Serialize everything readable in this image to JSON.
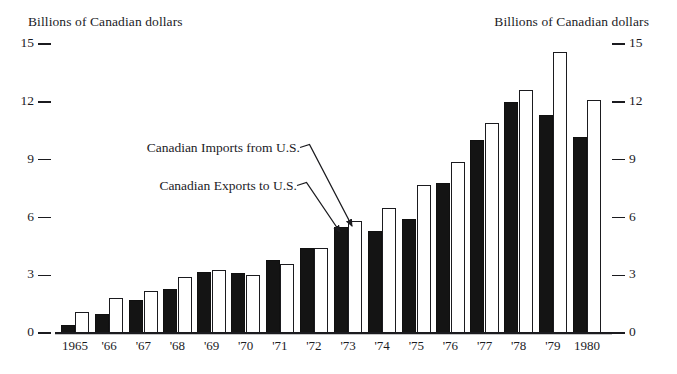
{
  "chart_data": {
    "type": "bar",
    "title": "",
    "axis_title_left": "Billions of Canadian dollars",
    "axis_title_right": "Billions of Canadian dollars",
    "xlabel": "",
    "ylabel": "Billions of Canadian dollars",
    "ylim": [
      0,
      15
    ],
    "yticks": [
      0,
      3,
      6,
      9,
      12,
      15
    ],
    "ytick_labels": [
      "0",
      "3",
      "6",
      "9",
      "12",
      "15"
    ],
    "grid": false,
    "legend_position": "annotation-labels-with-leader-lines",
    "categories": [
      "1965",
      "'66",
      "'67",
      "'68",
      "'69",
      "'70",
      "'71",
      "'72",
      "'73",
      "'74",
      "'75",
      "'76",
      "'77",
      "'78",
      "'79",
      "1980"
    ],
    "series": [
      {
        "name": "Canadian Exports to U.S.",
        "style": "solid-black",
        "color": "#141414",
        "values": [
          0.4,
          1.0,
          1.7,
          2.3,
          3.2,
          3.1,
          3.8,
          4.4,
          5.5,
          5.3,
          5.9,
          7.8,
          10.0,
          12.0,
          11.3,
          10.2
        ]
      },
      {
        "name": "Canadian Imports from U.S.",
        "style": "open-white",
        "color": "#ffffff",
        "values": [
          1.1,
          1.8,
          2.2,
          2.9,
          3.3,
          3.0,
          3.6,
          4.4,
          5.8,
          6.5,
          7.7,
          8.9,
          10.9,
          12.6,
          14.6,
          12.1
        ]
      }
    ],
    "annotations": [
      {
        "text": "Canadian Imports from U.S.",
        "points_to": "1973 open bar"
      },
      {
        "text": "Canadian Exports to U.S.",
        "points_to": "1973 solid bar"
      }
    ]
  },
  "labels": {
    "axis_title_left": "Billions of Canadian dollars",
    "axis_title_right": "Billions of Canadian dollars",
    "annotation_imports": "Canadian Imports from U.S.",
    "annotation_exports": "Canadian Exports to U.S."
  },
  "ticks": {
    "left": [
      "15",
      "12",
      "9",
      "6",
      "3",
      "0"
    ],
    "right": [
      "15",
      "12",
      "9",
      "6",
      "3",
      "0"
    ]
  },
  "xaxis": {
    "labels": [
      "1965",
      "'66",
      "'67",
      "'68",
      "'69",
      "'70",
      "'71",
      "'72",
      "'73",
      "'74",
      "'75",
      "'76",
      "'77",
      "'78",
      "'79",
      "1980"
    ]
  },
  "colors": {
    "exports_bar": "#141414",
    "imports_bar": "#ffffff",
    "ink": "#1b1b1f",
    "background": "#ffffff"
  }
}
